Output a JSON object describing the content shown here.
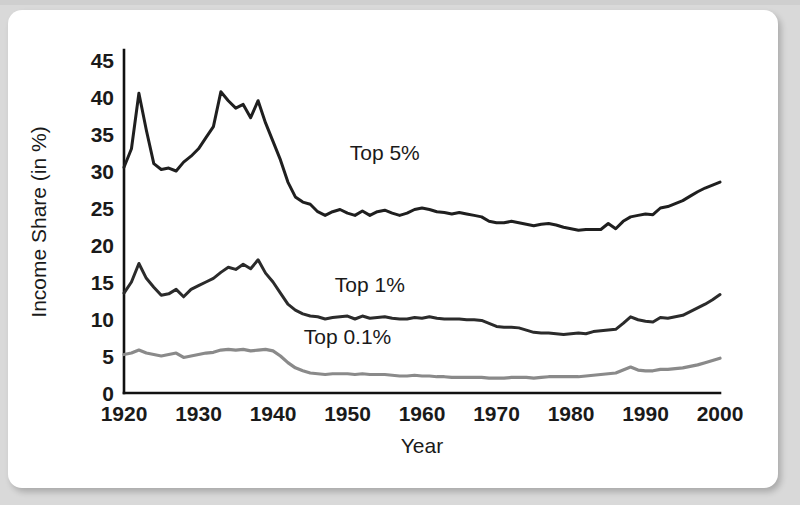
{
  "figure": {
    "background_color": "#ffffff",
    "page_background_color": "#d9d9d9"
  },
  "chart_data": {
    "type": "line",
    "title": "",
    "xlabel": "Year",
    "ylabel": "Income Share (in %)",
    "xlim": [
      1920,
      2000
    ],
    "ylim": [
      0,
      45
    ],
    "grid": false,
    "legend_position": "inline-annotations",
    "xticks": [
      1920,
      1930,
      1940,
      1950,
      1960,
      1970,
      1980,
      1990,
      2000
    ],
    "xtick_labels": [
      "1920",
      "1930",
      "1940",
      "1950",
      "1960",
      "1970",
      "1980",
      "1990",
      "2000"
    ],
    "yticks": [
      0,
      5,
      10,
      15,
      20,
      25,
      30,
      35,
      40,
      45
    ],
    "ytick_labels": [
      "0",
      "5",
      "10",
      "15",
      "20",
      "25",
      "30",
      "35",
      "40",
      "45"
    ],
    "x": [
      1920,
      1921,
      1922,
      1923,
      1924,
      1925,
      1926,
      1927,
      1928,
      1929,
      1930,
      1931,
      1932,
      1933,
      1934,
      1935,
      1936,
      1937,
      1938,
      1939,
      1940,
      1941,
      1942,
      1943,
      1944,
      1945,
      1946,
      1947,
      1948,
      1949,
      1950,
      1951,
      1952,
      1953,
      1954,
      1955,
      1956,
      1957,
      1958,
      1959,
      1960,
      1961,
      1962,
      1963,
      1964,
      1965,
      1966,
      1967,
      1968,
      1969,
      1970,
      1971,
      1972,
      1973,
      1974,
      1975,
      1976,
      1977,
      1978,
      1979,
      1980,
      1981,
      1982,
      1983,
      1984,
      1985,
      1986,
      1987,
      1988,
      1989,
      1990,
      1991,
      1992,
      1993,
      1994,
      1995,
      1996,
      1997,
      1998,
      1999,
      2000
    ],
    "series": [
      {
        "name": "Top 5%",
        "color": "#1f1f1f",
        "line_width": 3.0,
        "label_text": "Top 5%",
        "label_x": 1955,
        "label_y": 31.5,
        "values": [
          30.5,
          33.0,
          40.5,
          35.5,
          31.0,
          30.2,
          30.4,
          30.0,
          31.2,
          32.0,
          33.0,
          34.5,
          36.0,
          40.7,
          39.5,
          38.5,
          39.0,
          37.2,
          39.5,
          36.5,
          34.0,
          31.5,
          28.5,
          26.5,
          25.8,
          25.5,
          24.5,
          24.0,
          24.5,
          24.8,
          24.3,
          24.0,
          24.6,
          24.0,
          24.5,
          24.7,
          24.3,
          24.0,
          24.3,
          24.8,
          25.0,
          24.8,
          24.5,
          24.4,
          24.2,
          24.4,
          24.2,
          24.0,
          23.8,
          23.2,
          23.0,
          23.0,
          23.2,
          23.0,
          22.8,
          22.6,
          22.8,
          22.9,
          22.7,
          22.4,
          22.2,
          22.0,
          22.1,
          22.1,
          22.1,
          22.9,
          22.2,
          23.2,
          23.8,
          24.0,
          24.2,
          24.1,
          25.0,
          25.2,
          25.6,
          26.0,
          26.6,
          27.2,
          27.7,
          28.1,
          28.5
        ]
      },
      {
        "name": "Top 1%",
        "color": "#2b2b2b",
        "line_width": 3.0,
        "label_text": "Top 1%",
        "label_x": 1953,
        "label_y": 13.6,
        "values": [
          13.5,
          15.0,
          17.5,
          15.5,
          14.3,
          13.2,
          13.4,
          14.0,
          13.0,
          14.0,
          14.5,
          15.0,
          15.5,
          16.3,
          17.0,
          16.7,
          17.4,
          16.8,
          18.0,
          16.2,
          15.0,
          13.5,
          12.0,
          11.2,
          10.7,
          10.4,
          10.3,
          10.0,
          10.2,
          10.3,
          10.4,
          10.0,
          10.4,
          10.1,
          10.2,
          10.3,
          10.1,
          10.0,
          10.0,
          10.2,
          10.1,
          10.3,
          10.1,
          10.0,
          10.0,
          10.0,
          9.9,
          9.9,
          9.8,
          9.4,
          9.0,
          8.9,
          8.9,
          8.8,
          8.5,
          8.2,
          8.1,
          8.1,
          8.0,
          7.9,
          8.0,
          8.1,
          8.0,
          8.3,
          8.4,
          8.5,
          8.6,
          9.4,
          10.3,
          9.9,
          9.7,
          9.6,
          10.2,
          10.1,
          10.3,
          10.5,
          11.0,
          11.5,
          12.0,
          12.6,
          13.3
        ]
      },
      {
        "name": "Top 0.1%",
        "color": "#8a8a8a",
        "line_width": 3.2,
        "label_text": "Top 0.1%",
        "label_x": 1950,
        "label_y": 6.6,
        "values": [
          5.2,
          5.4,
          5.8,
          5.4,
          5.2,
          5.0,
          5.2,
          5.4,
          4.8,
          5.0,
          5.2,
          5.4,
          5.5,
          5.8,
          5.9,
          5.8,
          5.9,
          5.7,
          5.8,
          5.9,
          5.7,
          5.0,
          4.1,
          3.4,
          3.0,
          2.7,
          2.6,
          2.5,
          2.6,
          2.6,
          2.6,
          2.5,
          2.6,
          2.5,
          2.5,
          2.5,
          2.4,
          2.3,
          2.3,
          2.4,
          2.3,
          2.3,
          2.2,
          2.2,
          2.1,
          2.1,
          2.1,
          2.1,
          2.1,
          2.0,
          2.0,
          2.0,
          2.1,
          2.1,
          2.1,
          2.0,
          2.1,
          2.2,
          2.2,
          2.2,
          2.2,
          2.2,
          2.3,
          2.4,
          2.5,
          2.6,
          2.7,
          3.1,
          3.5,
          3.1,
          3.0,
          3.0,
          3.2,
          3.2,
          3.3,
          3.4,
          3.6,
          3.8,
          4.1,
          4.4,
          4.7
        ]
      }
    ]
  }
}
